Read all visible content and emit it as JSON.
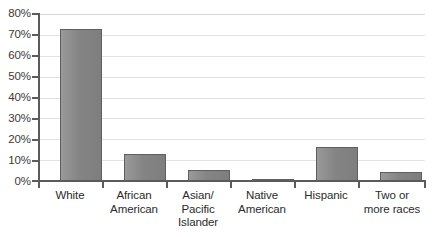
{
  "chart_data": {
    "type": "bar",
    "title": "",
    "subtitle": "",
    "xlabel": "",
    "ylabel": "",
    "categories": [
      "White",
      "African American",
      "Asian/ Pacific Islander",
      "Native American",
      "Hispanic",
      "Two or more races"
    ],
    "category_lines": [
      [
        "White"
      ],
      [
        "African",
        "American"
      ],
      [
        "Asian/",
        "Pacific",
        "Islander"
      ],
      [
        "Native",
        "American"
      ],
      [
        "Hispanic"
      ],
      [
        "Two or",
        "more races"
      ]
    ],
    "values": [
      73,
      13,
      5.5,
      1,
      16.5,
      4.5
    ],
    "ylim": [
      0,
      80
    ],
    "ytick_values": [
      0,
      10,
      20,
      30,
      40,
      50,
      60,
      70,
      80
    ],
    "ytick_labels": [
      "0%",
      "10%",
      "20%",
      "30%",
      "40%",
      "50%",
      "60%",
      "70%",
      "80%"
    ],
    "grid": true,
    "grid_axis": "y",
    "legend": false,
    "legend_position": "none",
    "bar_color": "#848484",
    "bar_border_color": "#5f5f5f",
    "gridline_color": "#e3e3e3",
    "axis_color": "#5b5b5b",
    "tick_label_color": "#3a3a3a",
    "background_color": "#ffffff"
  }
}
